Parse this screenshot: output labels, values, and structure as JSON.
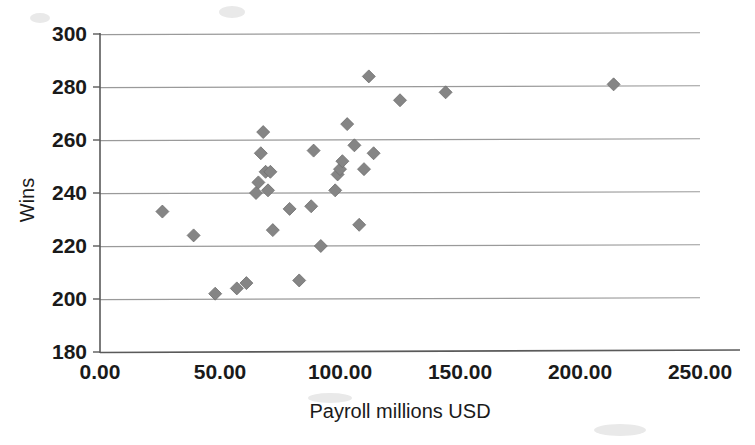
{
  "chart_data": {
    "type": "scatter",
    "title": "",
    "xlabel": "Payroll millions USD",
    "ylabel": "Wins",
    "xlim": [
      0,
      250
    ],
    "ylim": [
      180,
      300
    ],
    "xticks": [
      "0.00",
      "50.00",
      "100.00",
      "150.00",
      "200.00",
      "250.00"
    ],
    "xtick_values": [
      0,
      50,
      100,
      150,
      200,
      250
    ],
    "yticks": [
      "300",
      "280",
      "260",
      "240",
      "220",
      "200",
      "180"
    ],
    "ytick_values": [
      300,
      280,
      260,
      240,
      220,
      200,
      180
    ],
    "grid": "horizontal",
    "legend": "none",
    "marker_shape": "diamond",
    "marker_color": "#858585",
    "points": [
      {
        "x": 26,
        "y": 233
      },
      {
        "x": 39,
        "y": 224
      },
      {
        "x": 48,
        "y": 202
      },
      {
        "x": 57,
        "y": 204
      },
      {
        "x": 61,
        "y": 206
      },
      {
        "x": 65,
        "y": 240
      },
      {
        "x": 66,
        "y": 244
      },
      {
        "x": 67,
        "y": 255
      },
      {
        "x": 68,
        "y": 263
      },
      {
        "x": 69,
        "y": 248
      },
      {
        "x": 70,
        "y": 241
      },
      {
        "x": 71,
        "y": 248
      },
      {
        "x": 72,
        "y": 226
      },
      {
        "x": 79,
        "y": 234
      },
      {
        "x": 83,
        "y": 207
      },
      {
        "x": 88,
        "y": 235
      },
      {
        "x": 89,
        "y": 256
      },
      {
        "x": 92,
        "y": 220
      },
      {
        "x": 98,
        "y": 241
      },
      {
        "x": 99,
        "y": 247
      },
      {
        "x": 100,
        "y": 249
      },
      {
        "x": 101,
        "y": 252
      },
      {
        "x": 103,
        "y": 266
      },
      {
        "x": 106,
        "y": 258
      },
      {
        "x": 108,
        "y": 228
      },
      {
        "x": 110,
        "y": 249
      },
      {
        "x": 112,
        "y": 284
      },
      {
        "x": 114,
        "y": 255
      },
      {
        "x": 125,
        "y": 275
      },
      {
        "x": 144,
        "y": 278
      },
      {
        "x": 214,
        "y": 281
      }
    ]
  },
  "axes": {
    "y_title": "Wins",
    "x_title": "Payroll millions USD"
  }
}
